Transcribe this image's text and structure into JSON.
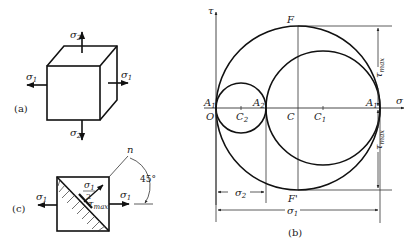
{
  "figure": {
    "panels": {
      "a": {
        "caption": "(a)",
        "element": "cube",
        "labels": {
          "sigma1_left": "σ",
          "sigma1_left_sub": "1",
          "sigma1_right": "σ",
          "sigma1_right_sub": "1",
          "sigma2_top": "σ",
          "sigma2_top_sub": "2",
          "sigma2_bottom": "σ",
          "sigma2_bottom_sub": "2"
        }
      },
      "b": {
        "caption": "(b)",
        "axes": {
          "x_label": "σ",
          "y_label": "τ",
          "origin": "O"
        },
        "points": {
          "A1_left": "A",
          "A1_left_sub": "1",
          "A2": "A",
          "A2_sub": "2",
          "A1_right": "A",
          "A1_right_sub": "1",
          "C": "C",
          "C1": "C",
          "C1_sub": "1",
          "C2": "C",
          "C2_sub": "2",
          "F": "F",
          "F_prime": "F'"
        },
        "dimensions": {
          "tau_max_upper": "τ",
          "tau_max_upper_sub": "max",
          "tau_max_lower": "τ",
          "tau_max_lower_sub": "max",
          "sigma2": "σ",
          "sigma2_sub": "2",
          "sigma1": "σ",
          "sigma1_sub": "1"
        }
      },
      "c": {
        "caption": "(c)",
        "element": "square with 45° inclined section",
        "labels": {
          "sigma1_left": "σ",
          "sigma1_left_sub": "1",
          "sigma1_right": "σ",
          "sigma1_right_sub": "1",
          "normal_stress_num": "σ",
          "normal_stress_num_sub": "1",
          "normal_stress_den": "2",
          "tau": "τ",
          "tau_sub": "max",
          "normal": "n",
          "angle": "45°"
        }
      }
    }
  }
}
